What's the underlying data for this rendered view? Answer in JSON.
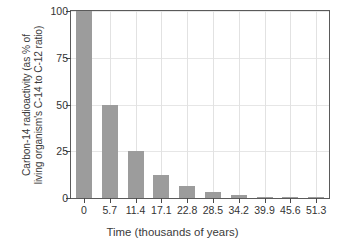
{
  "chart_data": {
    "type": "bar",
    "title": "",
    "xlabel": "Time (thousands of years)",
    "ylabel_line1": "Carbon-14 radioactivity (as % of",
    "ylabel_line2": "living organism's C-14 to C-12 ratio)",
    "categories": [
      "0",
      "5.7",
      "11.4",
      "17.1",
      "22.8",
      "28.5",
      "34.2",
      "39.9",
      "45.6",
      "51.3"
    ],
    "values": [
      100,
      50,
      25,
      12.5,
      6.25,
      3.13,
      1.56,
      0.78,
      0.39,
      0.2
    ],
    "ylim": [
      0,
      100
    ],
    "yticks": [
      0,
      25,
      50,
      75,
      100
    ],
    "ytick_labels": [
      "0",
      "25",
      "50",
      "75",
      "100"
    ],
    "grid": "both",
    "legend": "none",
    "bar_color": "#9c9c9c",
    "axis_color": "#5a5a5a",
    "grid_color": "#e2e2e2",
    "background": "#ffffff"
  }
}
